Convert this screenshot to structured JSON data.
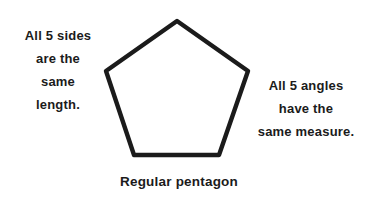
{
  "figure": {
    "title": "Regular pentagon",
    "background_color": "#ffffff",
    "stroke_color": "#1b1b1b",
    "text_color": "#1b1b1b"
  },
  "annotations": {
    "left": {
      "name": "sides-annotation",
      "lines": [
        "All 5 sides",
        "are the",
        "same",
        "length."
      ],
      "full_text": "All 5 sides are the same length."
    },
    "right": {
      "name": "angles-annotation",
      "lines": [
        "All 5 angles",
        "have the",
        "same measure."
      ],
      "full_text": "All 5 angles have the same measure."
    }
  },
  "caption": {
    "text": "Regular pentagon"
  },
  "chart_data": {
    "type": "diagram",
    "shape": "regular-pentagon",
    "sides": 5,
    "stroke_width": 4,
    "stroke_color": "#1b1b1b",
    "fill": "none",
    "vertices": [
      {
        "name": "top",
        "x": 177,
        "y": 21
      },
      {
        "name": "upper-right",
        "x": 248,
        "y": 71
      },
      {
        "name": "lower-right",
        "x": 219,
        "y": 155
      },
      {
        "name": "lower-left",
        "x": 134,
        "y": 155
      },
      {
        "name": "upper-left",
        "x": 106,
        "y": 71
      }
    ],
    "points_attr": "177,21 248,71 219,155 134,155 106,71",
    "properties": [
      "All 5 sides are the same length.",
      "All 5 angles have the same measure."
    ]
  }
}
